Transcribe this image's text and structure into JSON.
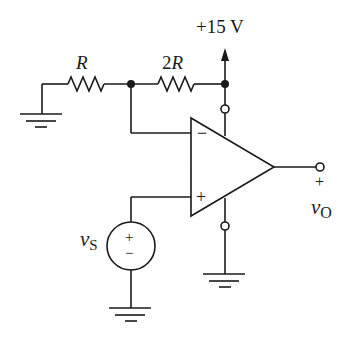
{
  "diagram": {
    "type": "op-amp circuit (non-inverting amplifier)",
    "supply_label": "+15 V",
    "resistors": [
      {
        "id": "r1",
        "label_italic": "R",
        "label_prefix": ""
      },
      {
        "id": "r2",
        "label_prefix": "2",
        "label_italic": "R"
      }
    ],
    "opamp": {
      "inverting_symbol": "−",
      "noninverting_symbol": "+"
    },
    "source": {
      "label_main": "v",
      "label_sub": "S",
      "plus": "+",
      "minus": "−"
    },
    "output": {
      "plus": "+",
      "label_main": "v",
      "label_sub": "O"
    },
    "colors": {
      "stroke": "#1a1a1a",
      "background": "#ffffff"
    }
  }
}
